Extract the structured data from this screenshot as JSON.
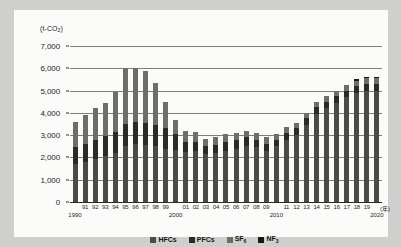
{
  "chart_data": {
    "type": "bar",
    "stacked": true,
    "title": "",
    "unit_label": "(t-CO2)",
    "unit_label_html": "(t-CO<sub>2</sub>)",
    "xlabel": "(年)",
    "ylabel": "",
    "ylim": [
      0,
      7000
    ],
    "ytick_labels": [
      "7,000",
      "6,000",
      "5,000",
      "4,000",
      "3,000",
      "2,000",
      "1,000",
      "0"
    ],
    "ytick_values": [
      7000,
      6000,
      5000,
      4000,
      3000,
      2000,
      1000,
      0
    ],
    "grid": true,
    "legend_position": "bottom-center",
    "categories": [
      "1990",
      "91",
      "92",
      "93",
      "94",
      "95",
      "96",
      "97",
      "98",
      "99",
      "2000",
      "01",
      "02",
      "03",
      "04",
      "05",
      "06",
      "07",
      "08",
      "09",
      "2010",
      "11",
      "12",
      "13",
      "14",
      "15",
      "16",
      "17",
      "18",
      "19",
      "2020"
    ],
    "tick_labels_short": [
      "",
      "91",
      "92",
      "93",
      "94",
      "95",
      "96",
      "97",
      "98",
      "99",
      "",
      "01",
      "02",
      "03",
      "04",
      "05",
      "06",
      "07",
      "08",
      "09",
      "",
      "11",
      "12",
      "13",
      "14",
      "15",
      "16",
      "17",
      "18",
      "19",
      ""
    ],
    "decade_labels": [
      {
        "text": "1990",
        "category": "1990"
      },
      {
        "text": "2000",
        "category": "2000"
      },
      {
        "text": "2010",
        "category": "2010"
      },
      {
        "text": "2020",
        "category": "2020"
      }
    ],
    "series": [
      {
        "name": "HFCs",
        "color": "#4a4a46",
        "values": [
          1700,
          1800,
          1950,
          2050,
          2200,
          2500,
          2600,
          2550,
          2500,
          2400,
          2350,
          2250,
          2300,
          2150,
          2200,
          2300,
          2400,
          2500,
          2450,
          2300,
          2500,
          2800,
          3000,
          3450,
          3950,
          4200,
          4450,
          4700,
          4900,
          5000,
          5000
        ]
      },
      {
        "name": "PFCs",
        "color": "#2a2a27",
        "values": [
          750,
          800,
          850,
          900,
          950,
          1000,
          1000,
          1000,
          950,
          900,
          700,
          450,
          400,
          350,
          350,
          400,
          400,
          400,
          350,
          300,
          300,
          300,
          300,
          300,
          300,
          300,
          300,
          300,
          300,
          300,
          300
        ]
      },
      {
        "name": "SF6",
        "name_html": "SF<sub>6</sub>",
        "color": "#6e6e68",
        "values": [
          1150,
          1300,
          1400,
          1500,
          1800,
          2500,
          2400,
          2350,
          1900,
          1200,
          650,
          500,
          450,
          350,
          350,
          350,
          300,
          300,
          300,
          300,
          250,
          250,
          250,
          250,
          250,
          250,
          250,
          250,
          250,
          250,
          250
        ]
      },
      {
        "name": "NF3",
        "name_html": "NF<sub>3</sub>",
        "color": "#181816",
        "values": [
          0,
          0,
          0,
          0,
          0,
          0,
          0,
          0,
          0,
          0,
          0,
          0,
          0,
          0,
          0,
          0,
          0,
          0,
          0,
          0,
          0,
          0,
          0,
          0,
          0,
          0,
          0,
          0,
          50,
          50,
          50
        ]
      }
    ],
    "totals": [
      3600,
      3900,
      4200,
      4450,
      4950,
      6000,
      6000,
      5900,
      5350,
      4500,
      3700,
      3200,
      3150,
      2850,
      2900,
      3050,
      3100,
      3200,
      3100,
      2900,
      3050,
      3350,
      3550,
      4000,
      4500,
      4750,
      5000,
      5250,
      5500,
      5600,
      5600
    ]
  },
  "legend": {
    "items": [
      {
        "label": "HFCs",
        "color": "#4a4a46"
      },
      {
        "label": "PFCs",
        "color": "#2a2a27"
      },
      {
        "label": "SF6",
        "color": "#6e6e68"
      },
      {
        "label": "NF3",
        "color": "#181816"
      }
    ]
  }
}
